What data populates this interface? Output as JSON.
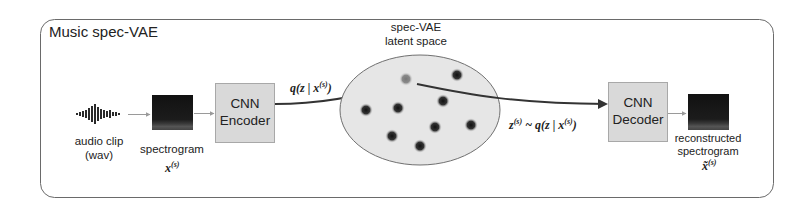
{
  "title": "Music spec-VAE",
  "colors": {
    "frame": "#6a6a6a",
    "box_fill": "#d9d9d9",
    "box_stroke": "#a8a8a8",
    "latent_fill": "#e6e6e6",
    "latent_stroke": "#707070",
    "spectrogram": "#1a1a1a",
    "arrow_thin": "#9a9a9a",
    "arrow_thick": "#333333",
    "point": "#2a2a2a"
  },
  "nodes": {
    "audio": {
      "label_line1": "audio clip",
      "label_line2": "(wav)"
    },
    "spectrogram": {
      "label": "spectrogram",
      "symbol": "x",
      "superscript": "(s)"
    },
    "encoder": {
      "line1": "CNN",
      "line2": "Encoder"
    },
    "latent": {
      "line1": "spec-VAE",
      "line2": "latent space"
    },
    "decoder": {
      "line1": "CNN",
      "line2": "Decoder"
    },
    "reconstructed": {
      "line1": "reconstructed",
      "line2": "spectrogram",
      "symbol": "x̃",
      "superscript": "(s)"
    }
  },
  "edges": {
    "encode_label": {
      "prefix": "q(z | x",
      "sup": "(s)",
      "suffix": ")"
    },
    "sample_label": {
      "z": "z",
      "zsup": "(s)",
      "mid": " ~ q(z | x",
      "xsup": "(s)",
      "suffix": ")"
    }
  },
  "latent_points": [
    {
      "x": 406,
      "y": 79,
      "faded": true
    },
    {
      "x": 457,
      "y": 75,
      "faded": false
    },
    {
      "x": 443,
      "y": 101,
      "faded": false
    },
    {
      "x": 366,
      "y": 110,
      "faded": false
    },
    {
      "x": 398,
      "y": 108,
      "faded": false
    },
    {
      "x": 435,
      "y": 127,
      "faded": false
    },
    {
      "x": 471,
      "y": 125,
      "faded": false
    },
    {
      "x": 392,
      "y": 136,
      "faded": false
    },
    {
      "x": 420,
      "y": 146,
      "faded": false
    }
  ]
}
